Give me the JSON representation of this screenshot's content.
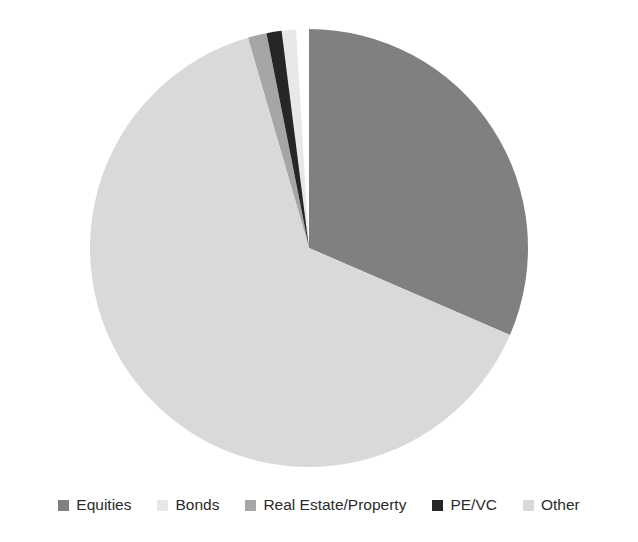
{
  "chart_data": {
    "type": "pie",
    "title": "",
    "subtitle": "",
    "xlabel": "",
    "ylabel": "",
    "grid": false,
    "legend_position": "bottom",
    "start_angle_deg": 0,
    "direction": "clockwise",
    "categories": [
      "Equities",
      "Bonds",
      "Real Estate/Property",
      "PE/VC",
      "Other"
    ],
    "values": [
      31.5,
      2.0,
      1.4,
      1.1,
      64.0
    ],
    "colors": [
      "#808080",
      "#e8e8e8",
      "#a6a6a6",
      "#262626",
      "#d9d9d9"
    ],
    "series": [
      {
        "name": "Asset allocation",
        "values": [
          31.5,
          2.0,
          1.4,
          1.1,
          64.0
        ]
      }
    ],
    "slices": [
      {
        "label": "Equities",
        "value": 31.5,
        "color": "#808080",
        "start_deg": 0.0,
        "end_deg": 113.4
      },
      {
        "label": "Bonds",
        "value": 2.0,
        "color": "#e8e8e8",
        "start_deg": 349.9,
        "end_deg": 356.6
      },
      {
        "label": "Real Estate/Property",
        "value": 1.4,
        "color": "#a6a6a6",
        "start_deg": 343.8,
        "end_deg": 348.8
      },
      {
        "label": "PE/VC",
        "value": 1.1,
        "color": "#262626",
        "start_deg": 348.8,
        "end_deg": 352.8
      },
      {
        "label": "Other",
        "value": 64.0,
        "color": "#d9d9d9",
        "start_deg": 113.4,
        "end_deg": 343.8
      }
    ]
  },
  "legend": {
    "items": [
      {
        "label": "Equities",
        "color": "#808080"
      },
      {
        "label": "Bonds",
        "color": "#e8e8e8"
      },
      {
        "label": "Real Estate/Property",
        "color": "#a6a6a6"
      },
      {
        "label": "PE/VC",
        "color": "#262626"
      },
      {
        "label": "Other",
        "color": "#d9d9d9"
      }
    ]
  },
  "pie_geometry": {
    "center_x": 309,
    "center_y": 248,
    "radius": 219
  }
}
